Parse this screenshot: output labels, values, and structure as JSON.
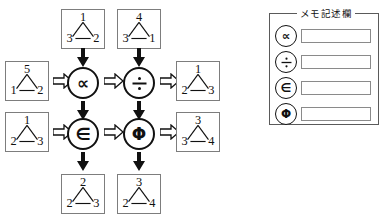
{
  "memo": {
    "title": "メモ記述欄",
    "rows": [
      {
        "symbol": "∝",
        "symbol_name": "proportional-to",
        "value": "",
        "placeholder": ""
      },
      {
        "symbol": "÷",
        "symbol_name": "division-sign",
        "value": "",
        "placeholder": ""
      },
      {
        "symbol": "∈",
        "symbol_name": "element-of",
        "value": "",
        "placeholder": ""
      },
      {
        "symbol": "Φ",
        "symbol_name": "phi",
        "value": "",
        "placeholder": ""
      }
    ]
  },
  "diagram": {
    "operators": [
      {
        "id": "op-prop",
        "symbol": "∝",
        "name": "proportional-to"
      },
      {
        "id": "op-divide",
        "symbol": "÷",
        "name": "division-sign"
      },
      {
        "id": "op-elem",
        "symbol": "∈",
        "name": "element-of"
      },
      {
        "id": "op-phi",
        "symbol": "Φ",
        "name": "phi"
      }
    ],
    "graphs": {
      "top_left": {
        "top": "1",
        "bottom_left": "3",
        "bottom_right": "2"
      },
      "top_right": {
        "top": "4",
        "bottom_left": "3",
        "bottom_right": "1"
      },
      "row1_input": {
        "top": "5",
        "bottom_left": "1",
        "bottom_right": "2"
      },
      "row1_output": {
        "top": "1",
        "bottom_left": "2",
        "bottom_right": "3"
      },
      "row2_input": {
        "top": "1",
        "bottom_left": "2",
        "bottom_right": "3"
      },
      "row2_output": {
        "top": "3",
        "bottom_left": "3",
        "bottom_right": "4"
      },
      "bottom_left": {
        "top": "2",
        "bottom_left": "2",
        "bottom_right": "3"
      },
      "bottom_right": {
        "top": "3",
        "bottom_left": "2",
        "bottom_right": "4"
      }
    },
    "colors": {
      "box_border": "#7d7d7d",
      "stroke": "#111111",
      "panel_border": "#5a5a5a",
      "background": "#ffffff"
    }
  }
}
